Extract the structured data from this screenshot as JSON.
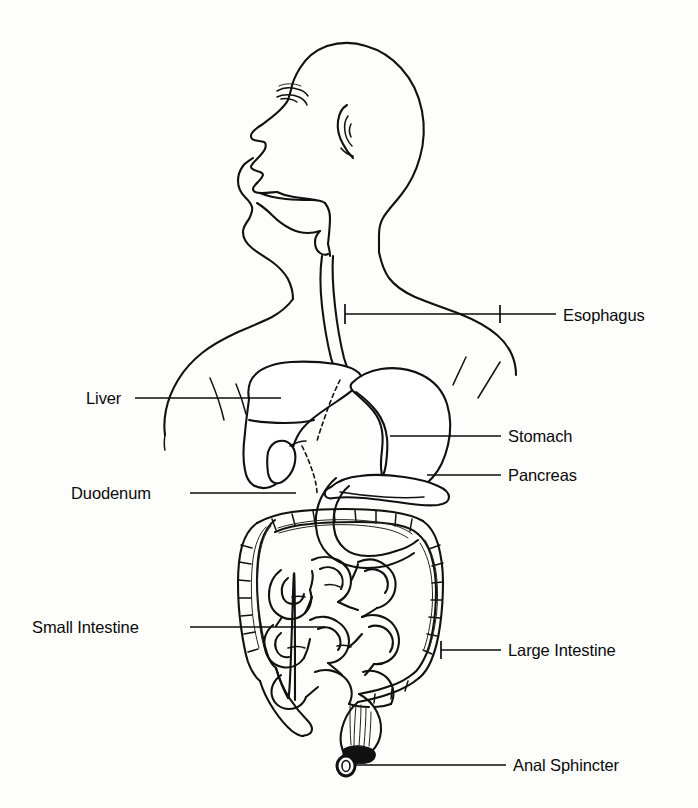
{
  "figure": {
    "style": "black-and-white line drawing, lateral view of head and torso with digestive organs",
    "background_color": "#fdfdfb",
    "line_color": "#111111"
  },
  "labels": [
    {
      "id": "esophagus",
      "text": "Esophagus",
      "side": "right",
      "text_x": 563,
      "text_y": 321,
      "leader": {
        "x1": 345,
        "y1": 314,
        "x2": 556,
        "y2": 314
      },
      "ticks": [
        {
          "x": 345,
          "y1": 304,
          "y2": 324
        },
        {
          "x": 500,
          "y1": 305,
          "y2": 323
        }
      ]
    },
    {
      "id": "stomach",
      "text": "Stomach",
      "side": "right",
      "text_x": 508,
      "text_y": 442,
      "leader": {
        "x1": 390,
        "y1": 436,
        "x2": 501,
        "y2": 436
      },
      "ticks": []
    },
    {
      "id": "pancreas",
      "text": "Pancreas",
      "side": "right",
      "text_x": 508,
      "text_y": 481,
      "leader": {
        "x1": 427,
        "y1": 475,
        "x2": 501,
        "y2": 475
      },
      "ticks": []
    },
    {
      "id": "large-intestine",
      "text": "Large Intestine",
      "side": "right",
      "text_x": 508,
      "text_y": 656,
      "leader": {
        "x1": 441,
        "y1": 650,
        "x2": 501,
        "y2": 650
      },
      "ticks": [
        {
          "x": 441,
          "y1": 641,
          "y2": 659
        }
      ]
    },
    {
      "id": "anal-sphincter",
      "text": "Anal Sphincter",
      "side": "right",
      "text_x": 513,
      "text_y": 771,
      "leader": {
        "x1": 348,
        "y1": 765,
        "x2": 506,
        "y2": 765
      },
      "ticks": []
    },
    {
      "id": "liver",
      "text": "Liver",
      "side": "left",
      "text_x": 86,
      "text_y": 404,
      "leader": {
        "x1": 135,
        "y1": 398,
        "x2": 281,
        "y2": 398
      },
      "ticks": []
    },
    {
      "id": "duodenum",
      "text": "Duodenum",
      "side": "left",
      "text_x": 71,
      "text_y": 499,
      "leader": {
        "x1": 190,
        "y1": 493,
        "x2": 296,
        "y2": 493
      },
      "ticks": []
    },
    {
      "id": "small-intestine",
      "text": "Small Intestine",
      "side": "left",
      "text_x": 32,
      "text_y": 633,
      "leader": {
        "x1": 190,
        "y1": 627,
        "x2": 325,
        "y2": 627
      },
      "ticks": []
    }
  ],
  "organs": [
    {
      "id": "head-profile",
      "name": "head and face in left profile"
    },
    {
      "id": "mouth-cavity",
      "name": "mouth and oral cavity"
    },
    {
      "id": "pharynx",
      "name": "pharynx"
    },
    {
      "id": "esophagus-tube",
      "name": "esophagus tube"
    },
    {
      "id": "torso",
      "name": "neck, shoulders and torso outline"
    },
    {
      "id": "liver",
      "name": "liver"
    },
    {
      "id": "gallbladder",
      "name": "gallbladder"
    },
    {
      "id": "bile-duct",
      "name": "bile duct (dashed)"
    },
    {
      "id": "stomach",
      "name": "stomach"
    },
    {
      "id": "pancreas",
      "name": "pancreas"
    },
    {
      "id": "duodenum",
      "name": "duodenum"
    },
    {
      "id": "small-intestine",
      "name": "small intestine coils"
    },
    {
      "id": "large-intestine",
      "name": "large intestine / colon"
    },
    {
      "id": "appendix",
      "name": "appendix"
    },
    {
      "id": "rectum",
      "name": "rectum"
    },
    {
      "id": "anal-sphincter",
      "name": "anal sphincter"
    }
  ]
}
